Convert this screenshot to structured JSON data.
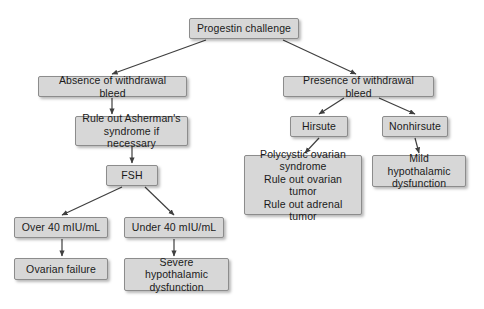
{
  "diagram": {
    "background_color": "#ffffff",
    "node_fill_color": "#d7d7d7",
    "node_border_color": "#8c8c8c",
    "edge_color": "#3f3f3f",
    "text_color": "#1a1a1a",
    "nodes": [
      {
        "id": "progestin-challenge",
        "label": "Progestin challenge",
        "x": 189,
        "y": 18,
        "w": 110,
        "h": 21
      },
      {
        "id": "absence-withdrawal-bleed",
        "label": "Absence of withdrawal bleed",
        "x": 38,
        "y": 76,
        "w": 149,
        "h": 21
      },
      {
        "id": "presence-withdrawal-bleed",
        "label": "Presence of withdrawal bleed",
        "x": 283,
        "y": 76,
        "w": 151,
        "h": 21
      },
      {
        "id": "rule-out-ashermans",
        "label": "Rule out Asherman's\nsyndrome if necessary",
        "x": 75,
        "y": 116,
        "w": 113,
        "h": 30
      },
      {
        "id": "fsh",
        "label": "FSH",
        "x": 106,
        "y": 165,
        "w": 52,
        "h": 21
      },
      {
        "id": "hirsute",
        "label": "Hirsute",
        "x": 290,
        "y": 116,
        "w": 58,
        "h": 21
      },
      {
        "id": "nonhirsute",
        "label": "Nonhirsute",
        "x": 382,
        "y": 116,
        "w": 66,
        "h": 21
      },
      {
        "id": "polycystic-ovarian-syndrome",
        "label": "Polycystic ovarian\nsyndrome\nRule out ovarian tumor\nRule out adrenal tumor",
        "x": 244,
        "y": 155,
        "w": 118,
        "h": 60
      },
      {
        "id": "mild-hypothalamic",
        "label": "Mild hypothalamic\ndysfunction",
        "x": 372,
        "y": 155,
        "w": 94,
        "h": 32
      },
      {
        "id": "over-40-miu",
        "label": "Over 40 mIU/mL",
        "x": 14,
        "y": 217,
        "w": 94,
        "h": 21
      },
      {
        "id": "under-40-miu",
        "label": "Under 40 mIU/mL",
        "x": 124,
        "y": 217,
        "w": 100,
        "h": 21
      },
      {
        "id": "ovarian-failure",
        "label": "Ovarian failure",
        "x": 14,
        "y": 258,
        "w": 94,
        "h": 22
      },
      {
        "id": "severe-hypothalamic",
        "label": "Severe hypothalamic\ndysfunction",
        "x": 124,
        "y": 258,
        "w": 105,
        "h": 33
      }
    ],
    "edges": [
      {
        "id": "progestin-to-absence",
        "from": "progestin-challenge",
        "to": "absence-withdrawal-bleed",
        "x1": 206,
        "y1": 40,
        "x2": 112,
        "y2": 74
      },
      {
        "id": "progestin-to-presence",
        "from": "progestin-challenge",
        "to": "presence-withdrawal-bleed",
        "x1": 283,
        "y1": 40,
        "x2": 356,
        "y2": 74
      },
      {
        "id": "absence-to-ashermans",
        "from": "absence-withdrawal-bleed",
        "to": "rule-out-ashermans",
        "x1": 112,
        "y1": 98,
        "x2": 112,
        "y2": 114
      },
      {
        "id": "ashermans-to-fsh",
        "from": "rule-out-ashermans",
        "to": "fsh",
        "x1": 132,
        "y1": 147,
        "x2": 132,
        "y2": 163
      },
      {
        "id": "fsh-to-over40",
        "from": "fsh",
        "to": "over-40-miu",
        "x1": 122,
        "y1": 187,
        "x2": 62,
        "y2": 215
      },
      {
        "id": "fsh-to-under40",
        "from": "fsh",
        "to": "under-40-miu",
        "x1": 145,
        "y1": 187,
        "x2": 174,
        "y2": 215
      },
      {
        "id": "over40-to-ovarian-failure",
        "from": "over-40-miu",
        "to": "ovarian-failure",
        "x1": 62,
        "y1": 239,
        "x2": 62,
        "y2": 256
      },
      {
        "id": "under40-to-severe-hypo",
        "from": "under-40-miu",
        "to": "severe-hypothalamic",
        "x1": 174,
        "y1": 239,
        "x2": 174,
        "y2": 256
      },
      {
        "id": "presence-to-hirsute",
        "from": "presence-withdrawal-bleed",
        "to": "hirsute",
        "x1": 344,
        "y1": 98,
        "x2": 319,
        "y2": 114
      },
      {
        "id": "presence-to-nonhirsute",
        "from": "presence-withdrawal-bleed",
        "to": "nonhirsute",
        "x1": 379,
        "y1": 98,
        "x2": 415,
        "y2": 114
      },
      {
        "id": "hirsute-to-pcos",
        "from": "hirsute",
        "to": "polycystic-ovarian-syndrome",
        "x1": 319,
        "y1": 138,
        "x2": 305,
        "y2": 153
      },
      {
        "id": "nonhirsute-to-mild-hypo",
        "from": "nonhirsute",
        "to": "mild-hypothalamic",
        "x1": 415,
        "y1": 138,
        "x2": 419,
        "y2": 153
      }
    ]
  }
}
